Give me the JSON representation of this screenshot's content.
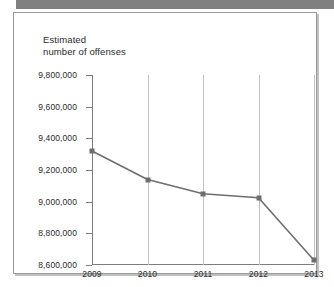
{
  "figure": {
    "title": "Estimated\nnumber of offenses"
  },
  "chart_data": {
    "type": "line",
    "title": "Estimated number of offenses",
    "xlabel": "",
    "ylabel": "Estimated number of offenses",
    "categories": [
      "2009",
      "2010",
      "2011",
      "2012",
      "2013"
    ],
    "x": [
      2009,
      2010,
      2011,
      2012,
      2013
    ],
    "values": [
      9320000,
      9140000,
      9050000,
      9025000,
      8630000
    ],
    "series": [
      {
        "name": "Estimated number of offenses",
        "values": [
          9320000,
          9140000,
          9050000,
          9025000,
          8630000
        ]
      }
    ],
    "ylim": [
      8600000,
      9800000
    ],
    "yticks": [
      8600000,
      8800000,
      9000000,
      9200000,
      9400000,
      9600000,
      9800000
    ],
    "ytick_labels": [
      "8,600,000",
      "8,800,000",
      "9,000,000",
      "9,200,000",
      "9,400,000",
      "9,600,000",
      "9,800,000"
    ],
    "xtick_labels": [
      "2009",
      "2010",
      "2011",
      "2012",
      "2013"
    ],
    "grid": "vertical",
    "legend": "none",
    "line_color": "#6e6e6e",
    "marker_color": "#6e6e6e",
    "grid_color": "#c2c2c2",
    "axis_color": "#7d7d7d",
    "text_color": "#2b2b2b",
    "banner_color": "#808080"
  }
}
